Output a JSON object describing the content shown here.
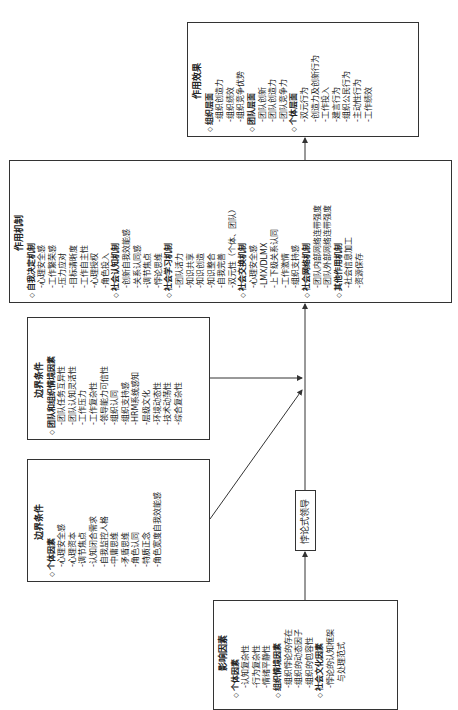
{
  "effects": {
    "title": "作用效果",
    "sections": [
      {
        "label": "组织层面",
        "items": [
          "组织创造力",
          "组织绩效",
          "组织竞争优势"
        ]
      },
      {
        "label": "团队层面",
        "items": [
          "团队创新",
          "团队创造力",
          "团队竞争力"
        ]
      },
      {
        "label": "个体层面",
        "items": [
          "双元行为",
          "创造力及创新行为",
          "工作投入",
          "建言行为",
          "组织公民行为",
          "主动性行为",
          "工作绩效"
        ]
      }
    ]
  },
  "mechanism": {
    "title": "作用机制",
    "sections": [
      {
        "label": "自我决定机制",
        "items": [
          "心理安全感",
          "工作繁荣感",
          "压力应对",
          "目标清晰度",
          "工作自主性",
          "心理授权",
          "角色投入"
        ]
      },
      {
        "label": "社会认知机制",
        "items": [
          "创新自我效能感",
          "关系认同感",
          "调节焦点",
          "悖论思维"
        ]
      },
      {
        "label": "社会学习机制",
        "items": [
          "团队活力",
          "知识共享",
          "知识创造",
          "知识整合",
          "自我完善",
          "双元性（个体、团队）"
        ]
      },
      {
        "label": "社会交换机制",
        "items": [
          "心理安全感",
          "LMX/DLMX",
          "上下级关系认同",
          "工作激情",
          "组织支持感"
        ]
      },
      {
        "label": "社会网络机制",
        "items": [
          "团队内部网络连带强度",
          "团队外部网络连带强度"
        ]
      },
      {
        "label": "其他作用机制",
        "items": [
          "社会信息加工",
          "资源保存"
        ]
      }
    ]
  },
  "boundary_team": {
    "title": "边界条件",
    "sections": [
      {
        "label": "团队和组织情境因素",
        "items": [
          "团队任务互异性",
          "团队认知灵活性",
          "工作压力",
          "工作复杂性",
          "领导能力可信性",
          "组织认同",
          "组织支持感",
          "HRM系统感知",
          "层级文化",
          "环境动态性",
          "技术动荡性",
          "综合复杂性"
        ]
      }
    ]
  },
  "boundary_individual": {
    "title": "边界条件",
    "sections": [
      {
        "label": "个体因素",
        "items": [
          "心理安全感",
          "心理资本",
          "调节焦点",
          "认知闭合需求",
          "自我监控人格",
          "中庸思维",
          "矛盾思维",
          "角色认同",
          "特质正念",
          "角色宽度自我效能感"
        ]
      }
    ]
  },
  "paradox_leader": {
    "label": "悖论式领导"
  },
  "influence": {
    "title": "影响因素",
    "sections": [
      {
        "label": "个体因素",
        "items": [
          "认知复杂性",
          "行为复杂性",
          "情绪平静性"
        ]
      },
      {
        "label": "组织情境因素",
        "items": [
          "组织悖论的存在",
          "组织的动态因子",
          "组织的包容性"
        ]
      },
      {
        "label": "社会文化因素",
        "items": [
          "悖论的认知框架",
          "与处理范式"
        ]
      }
    ]
  },
  "symbols": {
    "bullet": "◇"
  }
}
